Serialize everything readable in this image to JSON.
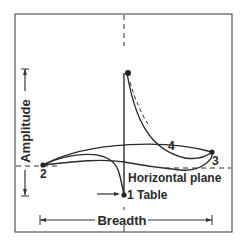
{
  "diagram": {
    "axis_labels": {
      "amplitude": "Amplitude",
      "breadth": "Breadth"
    },
    "annotations": {
      "horizontal_plane": "Horizontal plane",
      "table": "Table"
    },
    "points": [
      {
        "id": "1",
        "label": "1"
      },
      {
        "id": "2",
        "label": "2"
      },
      {
        "id": "3",
        "label": "3"
      },
      {
        "id": "4",
        "label": "4"
      }
    ],
    "colors": {
      "line": "#2a2a2a",
      "frame": "#555555",
      "background": "#ffffff"
    }
  }
}
